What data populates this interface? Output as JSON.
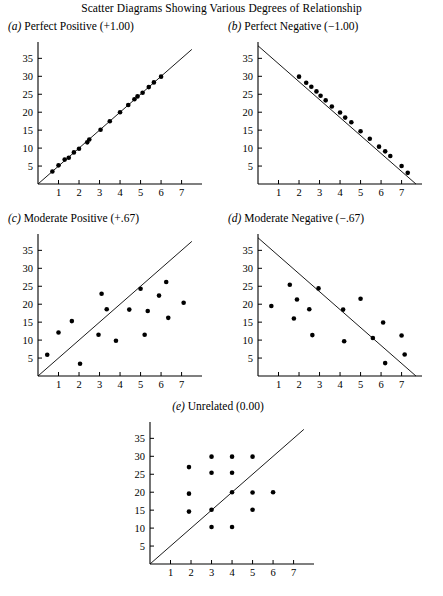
{
  "figure": {
    "title": "Scatter Diagrams Showing Various Degrees of Relationship"
  },
  "panels": [
    {
      "letter": "(a)",
      "label": "Perfect Positive (+1.00)",
      "id": "perfect-positive"
    },
    {
      "letter": "(b)",
      "label": "Perfect Negative (−1.00)",
      "id": "perfect-negative"
    },
    {
      "letter": "(c)",
      "label": "Moderate Positive (+.67)",
      "id": "moderate-positive"
    },
    {
      "letter": "(d)",
      "label": "Moderate Negative (−.67)",
      "id": "moderate-negative"
    },
    {
      "letter": "(e)",
      "label": "Unrelated (0.00)",
      "id": "unrelated"
    }
  ],
  "chart_data": [
    {
      "type": "scatter",
      "id": "perfect-positive",
      "title": "(a) Perfect Positive (+1.00)",
      "xlabel": "",
      "ylabel": "",
      "xlim": [
        0,
        7.8
      ],
      "ylim": [
        0,
        39
      ],
      "xticks": [
        1,
        2,
        3,
        4,
        5,
        6,
        7
      ],
      "yticks": [
        5,
        10,
        15,
        20,
        25,
        30,
        35
      ],
      "grid": false,
      "legend": "none",
      "reference_line": {
        "x0": 0,
        "y0": 0,
        "x1": 7.5,
        "y1": 37.5
      },
      "x": [
        0.7,
        1.0,
        1.3,
        1.5,
        1.75,
        2.0,
        2.4,
        2.5,
        3.05,
        3.5,
        4.0,
        4.4,
        4.7,
        4.85,
        5.1,
        5.4,
        5.65,
        6.0
      ],
      "y": [
        3.5,
        5.2,
        6.8,
        7.3,
        8.8,
        9.8,
        11.6,
        12.4,
        15.1,
        17.5,
        20.0,
        22.0,
        23.6,
        24.4,
        25.4,
        27.0,
        28.3,
        29.9
      ]
    },
    {
      "type": "scatter",
      "id": "perfect-negative",
      "title": "(b) Perfect Negative (−1.00)",
      "xlabel": "",
      "ylabel": "",
      "xlim": [
        0,
        7.8
      ],
      "ylim": [
        0,
        39
      ],
      "xticks": [
        1,
        2,
        3,
        4,
        5,
        6,
        7
      ],
      "yticks": [
        5,
        10,
        15,
        20,
        25,
        30,
        35
      ],
      "grid": false,
      "legend": "none",
      "reference_line": {
        "x0": 0,
        "y0": 38.5,
        "x1": 7.7,
        "y1": 0
      },
      "x": [
        2.0,
        2.35,
        2.6,
        2.85,
        3.05,
        3.3,
        3.6,
        4.0,
        4.25,
        4.55,
        5.0,
        5.45,
        5.9,
        6.2,
        6.45,
        7.0,
        7.3
      ],
      "y": [
        29.9,
        28.2,
        27.1,
        25.8,
        24.6,
        23.3,
        21.6,
        19.9,
        18.5,
        17.2,
        14.7,
        12.6,
        10.4,
        9.1,
        7.8,
        5.0,
        3.1
      ]
    },
    {
      "type": "scatter",
      "id": "moderate-positive",
      "title": "(c) Moderate Positive (+.67)",
      "xlabel": "",
      "ylabel": "",
      "xlim": [
        0,
        7.8
      ],
      "ylim": [
        0,
        39
      ],
      "xticks": [
        1,
        2,
        3,
        4,
        5,
        6,
        7
      ],
      "yticks": [
        5,
        10,
        15,
        20,
        25,
        30,
        35
      ],
      "grid": false,
      "legend": "none",
      "reference_line": {
        "x0": 0,
        "y0": 0,
        "x1": 7.5,
        "y1": 37.5
      },
      "x": [
        0.45,
        1.0,
        1.65,
        2.05,
        2.95,
        3.1,
        3.35,
        3.8,
        4.45,
        5.0,
        5.2,
        5.35,
        5.9,
        6.25,
        6.35,
        7.1
      ],
      "y": [
        5.9,
        12.1,
        15.3,
        3.4,
        11.5,
        22.9,
        18.6,
        9.8,
        18.5,
        24.3,
        11.5,
        18.1,
        22.4,
        26.2,
        16.2,
        20.4
      ]
    },
    {
      "type": "scatter",
      "id": "moderate-negative",
      "title": "(d) Moderate Negative (−.67)",
      "xlabel": "",
      "ylabel": "",
      "xlim": [
        0,
        7.8
      ],
      "ylim": [
        0,
        39
      ],
      "xticks": [
        1,
        2,
        3,
        4,
        5,
        6,
        7
      ],
      "yticks": [
        5,
        10,
        15,
        20,
        25,
        30,
        35
      ],
      "grid": false,
      "legend": "none",
      "reference_line": {
        "x0": 0,
        "y0": 38.5,
        "x1": 7.7,
        "y1": 0
      },
      "x": [
        0.65,
        1.55,
        1.75,
        1.9,
        2.5,
        2.65,
        2.95,
        4.15,
        4.2,
        5.0,
        5.6,
        6.1,
        6.2,
        7.0,
        7.15
      ],
      "y": [
        19.5,
        25.4,
        16.0,
        21.3,
        18.6,
        11.4,
        24.4,
        18.5,
        9.7,
        21.5,
        10.6,
        14.9,
        3.6,
        11.3,
        6.0
      ]
    },
    {
      "type": "scatter",
      "id": "unrelated",
      "title": "(e) Unrelated (0.00)",
      "xlabel": "",
      "ylabel": "",
      "xlim": [
        0,
        7.8
      ],
      "ylim": [
        0,
        39
      ],
      "xticks": [
        1,
        2,
        3,
        4,
        5,
        6,
        7
      ],
      "yticks": [
        5,
        10,
        15,
        20,
        25,
        30,
        35
      ],
      "grid": false,
      "legend": "none",
      "reference_line": {
        "x0": 0,
        "y0": 0,
        "x1": 7.5,
        "y1": 37.5
      },
      "x": [
        1.9,
        1.9,
        1.9,
        3.0,
        3.0,
        3.0,
        3.0,
        4.0,
        4.0,
        4.0,
        4.0,
        5.0,
        5.0,
        5.0,
        6.0
      ],
      "y": [
        27.0,
        19.6,
        14.6,
        29.9,
        25.4,
        15.1,
        10.3,
        29.9,
        25.4,
        20.0,
        10.3,
        29.9,
        19.9,
        15.1,
        20.0
      ]
    }
  ]
}
